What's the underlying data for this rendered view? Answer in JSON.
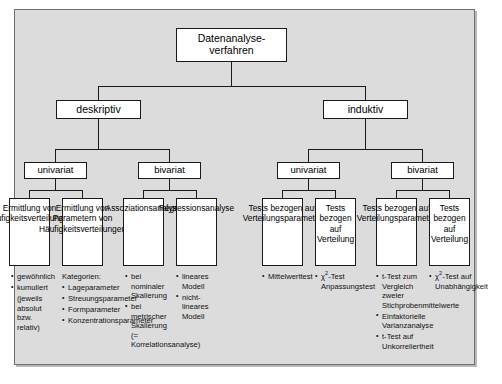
{
  "diagram": {
    "title_node": "Datenanalyse-\nverfahren",
    "root": {
      "label": "Datenanalyse-verfahren",
      "line1": "Datenanalyse-",
      "line2": "verfahren"
    },
    "level2": [
      {
        "label": "deskriptiv"
      },
      {
        "label": "induktiv"
      }
    ],
    "level3": [
      {
        "label": "univariat"
      },
      {
        "label": "bivariat"
      },
      {
        "label": "univariat"
      },
      {
        "label": "bivariat"
      }
    ],
    "leaves": [
      {
        "label": "Ermittlung von Häufigkeitsverteilungen"
      },
      {
        "label": "Ermittlung von Parametern von Häufigkeitsverteilungen"
      },
      {
        "label": "Assoziationsanalyse"
      },
      {
        "label": "Regressionsanalyse"
      },
      {
        "label": "Tests bezogen auf Verteilungsparameter"
      },
      {
        "label": "Tests bezogen auf Verteilung"
      },
      {
        "label": "Tests bezogen auf Verteilungsparameter"
      },
      {
        "label": "Tests bezogen auf Verteilung"
      }
    ],
    "notes": [
      {
        "id": "note-haeufigkeitsverteilungen",
        "header": "",
        "items": [
          {
            "text": "gewöhnlich",
            "bullet": true
          },
          {
            "text": "kumuliert",
            "bullet": true
          },
          {
            "text": "(jeweils absolut bzw. relativ)",
            "bullet": false
          }
        ]
      },
      {
        "id": "note-parameter",
        "header": "Kategorien:",
        "items": [
          {
            "text": "Lageparameter",
            "bullet": true
          },
          {
            "text": "Streuungsparameter",
            "bullet": true
          },
          {
            "text": "Formparameter",
            "bullet": true
          },
          {
            "text": "Konzentrationsparameter",
            "bullet": true
          }
        ]
      },
      {
        "id": "note-assoziationsanalyse",
        "header": "",
        "items": [
          {
            "text": "bei nominaler Skalierung",
            "bullet": true
          },
          {
            "text": "bei metrischer Skalierung (= Korrelationsanalyse)",
            "bullet": true
          }
        ]
      },
      {
        "id": "note-regressionsanalyse",
        "header": "",
        "items": [
          {
            "text": "lineares Modell",
            "bullet": true
          },
          {
            "text": "nicht-lineares Modell",
            "bullet": true
          }
        ]
      },
      {
        "id": "note-tests-verteilungsparameter-univariat",
        "header": "",
        "items": [
          {
            "text": "Mittelwerttest",
            "bullet": true
          }
        ]
      },
      {
        "id": "note-tests-verteilung-univariat",
        "header": "",
        "items": [
          {
            "text": "χ²-Test Anpassungstest",
            "bullet": true
          }
        ]
      },
      {
        "id": "note-tests-verteilungsparameter-bivariat",
        "header": "",
        "items": [
          {
            "text": "t-Test zum Vergleich zweier Stichprobenmittelwerte",
            "bullet": true
          },
          {
            "text": "Einfaktorielle Varianzanalyse",
            "bullet": true
          },
          {
            "text": "t-Test auf Unkorreliertheit",
            "bullet": true
          }
        ]
      },
      {
        "id": "note-tests-verteilung-bivariat",
        "header": "",
        "items": [
          {
            "text": "χ²-Test auf Unabhängigkeit",
            "bullet": true
          }
        ]
      }
    ],
    "colors": {
      "canvas": "#dcdcdc",
      "node_fill": "#ffffff",
      "line": "#1a1a1a",
      "frame_border": "#6e6e6e",
      "page": "#ffffff"
    }
  }
}
